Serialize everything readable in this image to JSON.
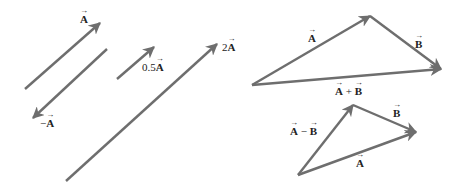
{
  "diagram": {
    "line_color": "#6e6e6e",
    "background": "#ffffff",
    "left_panel": {
      "arrows": [
        {
          "name": "A",
          "from": [
            25,
            89
          ],
          "to": [
            100,
            23
          ],
          "label_prefix": "",
          "label_vec": "A",
          "label_pos": [
            80,
            14
          ]
        },
        {
          "name": "-A",
          "from": [
            107,
            49
          ],
          "to": [
            33,
            118
          ],
          "label_prefix": "−",
          "label_vec": "A",
          "label_pos": [
            40,
            118
          ]
        },
        {
          "name": "0.5A",
          "from": [
            117,
            79
          ],
          "to": [
            154,
            47
          ],
          "label_prefix": "0.5",
          "label_vec": "A",
          "label_pos": [
            142,
            62
          ]
        },
        {
          "name": "2A",
          "from": [
            66,
            181
          ],
          "to": [
            217,
            44
          ],
          "label_prefix": "2",
          "label_vec": "A",
          "label_pos": [
            222,
            42
          ]
        }
      ]
    },
    "sum_triangle": {
      "arrows": [
        {
          "name": "A",
          "from": [
            252,
            85
          ],
          "to": [
            370,
            16
          ],
          "label_prefix": "",
          "label_vec": "A",
          "label_pos": [
            308,
            33
          ]
        },
        {
          "name": "B",
          "from": [
            370,
            16
          ],
          "to": [
            441,
            69
          ],
          "label_prefix": "",
          "label_vec": "B",
          "label_pos": [
            415,
            39
          ]
        },
        {
          "name": "A+B",
          "from": [
            252,
            85
          ],
          "to": [
            441,
            69
          ],
          "label_prefix": "",
          "label_vec": "A",
          "label_op": " + ",
          "label_vec2": "B",
          "label_pos": [
            335,
            86
          ]
        }
      ]
    },
    "difference_triangle": {
      "arrows": [
        {
          "name": "A-B",
          "from": [
            298,
            175
          ],
          "to": [
            353,
            105
          ],
          "label_prefix": "",
          "label_vec": "A",
          "label_op": " − ",
          "label_vec2": "B",
          "label_pos": [
            290,
            126
          ]
        },
        {
          "name": "B",
          "from": [
            353,
            105
          ],
          "to": [
            416,
            132
          ],
          "label_prefix": "",
          "label_vec": "B",
          "label_pos": [
            393,
            108
          ]
        },
        {
          "name": "A",
          "from": [
            298,
            175
          ],
          "to": [
            416,
            132
          ],
          "label_prefix": "",
          "label_vec": "A",
          "label_pos": [
            356,
            158
          ]
        }
      ]
    }
  }
}
